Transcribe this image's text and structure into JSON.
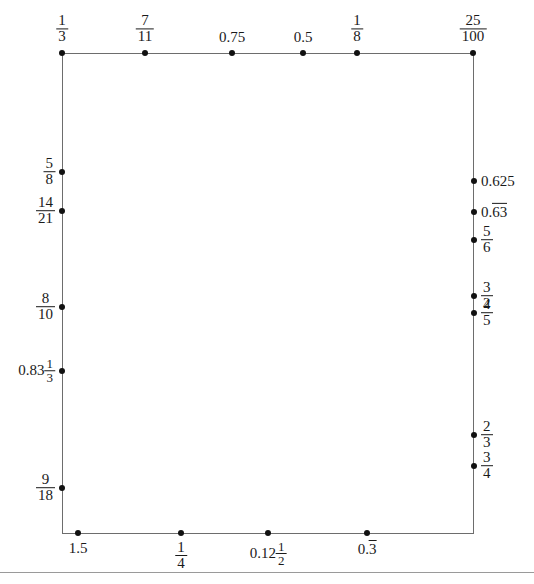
{
  "figure": {
    "rect": {
      "left": 62,
      "top": 53,
      "right": 474,
      "bottom": 533
    },
    "stroke_color": "#6d6d6d",
    "dot_color": "#111111",
    "text_color": "#1a1a1a"
  },
  "top_points": [
    {
      "id": "top-1",
      "x": 62,
      "label_kind": "fraction",
      "numerator": "1",
      "denominator": "3",
      "text": "1/3"
    },
    {
      "id": "top-2",
      "x": 145,
      "label_kind": "fraction",
      "numerator": "7",
      "denominator": "11",
      "text": "7/11"
    },
    {
      "id": "top-3",
      "x": 232,
      "label_kind": "plain",
      "text": "0.75"
    },
    {
      "id": "top-4",
      "x": 303,
      "label_kind": "plain",
      "text": "0.5"
    },
    {
      "id": "top-5",
      "x": 357,
      "label_kind": "fraction",
      "numerator": "1",
      "denominator": "8",
      "text": "1/8"
    },
    {
      "id": "top-6",
      "x": 473,
      "label_kind": "fraction",
      "numerator": "25",
      "denominator": "100",
      "text": "25/100"
    }
  ],
  "left_points": [
    {
      "id": "left-1",
      "y": 172,
      "label_kind": "fraction",
      "numerator": "5",
      "denominator": "8",
      "text": "5/8"
    },
    {
      "id": "left-2",
      "y": 211,
      "label_kind": "fraction",
      "numerator": "14",
      "denominator": "21",
      "text": "14/21"
    },
    {
      "id": "left-3",
      "y": 307,
      "label_kind": "fraction",
      "numerator": "8",
      "denominator": "10",
      "text": "8/10"
    },
    {
      "id": "left-4",
      "y": 371,
      "label_kind": "mixed",
      "whole": "0.83",
      "numerator": "1",
      "denominator": "3",
      "text": "0.83 1/3"
    },
    {
      "id": "left-5",
      "y": 488,
      "label_kind": "fraction",
      "numerator": "9",
      "denominator": "18",
      "text": "9/18"
    }
  ],
  "right_points": [
    {
      "id": "right-1",
      "y": 181,
      "label_kind": "plain",
      "text": "0.625"
    },
    {
      "id": "right-2",
      "y": 212,
      "label_kind": "repeating",
      "prefix": "0.",
      "repeat": "63",
      "text": "0.63 repeating"
    },
    {
      "id": "right-3",
      "y": 240,
      "label_kind": "fraction",
      "numerator": "5",
      "denominator": "6",
      "text": "5/6"
    },
    {
      "id": "right-4",
      "y": 296,
      "label_kind": "fraction",
      "numerator": "3",
      "denominator": "2",
      "text": "3/2"
    },
    {
      "id": "right-5",
      "y": 313,
      "label_kind": "fraction",
      "numerator": "4",
      "denominator": "5",
      "text": "4/5"
    },
    {
      "id": "right-6",
      "y": 435,
      "label_kind": "fraction",
      "numerator": "2",
      "denominator": "3",
      "text": "2/3"
    },
    {
      "id": "right-7",
      "y": 466,
      "label_kind": "fraction",
      "numerator": "3",
      "denominator": "4",
      "text": "3/4"
    }
  ],
  "bottom_points": [
    {
      "id": "bottom-1",
      "x": 78,
      "label_kind": "plain",
      "text": "1.5"
    },
    {
      "id": "bottom-2",
      "x": 181,
      "label_kind": "fraction",
      "numerator": "1",
      "denominator": "4",
      "text": "1/4"
    },
    {
      "id": "bottom-3",
      "x": 268,
      "label_kind": "mixed",
      "whole": "0.12",
      "numerator": "1",
      "denominator": "2",
      "text": "0.12 1/2"
    },
    {
      "id": "bottom-4",
      "x": 367,
      "label_kind": "repeating",
      "prefix": "0.",
      "repeat": "3",
      "text": "0.3 repeating"
    }
  ],
  "footer_rule": {
    "y": 572
  }
}
